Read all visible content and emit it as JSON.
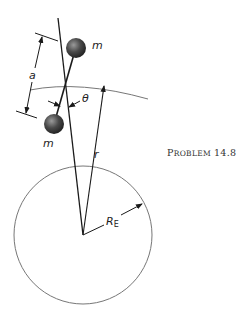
{
  "figure": {
    "caption_prefix_big": "P",
    "caption_prefix_small": "ROBLEM",
    "caption_number": "14.8",
    "labels": {
      "mass_top": "m",
      "mass_bottom": "m",
      "separation": "a",
      "angle": "θ",
      "radius_orbit": "r",
      "radius_earth_main": "R",
      "radius_earth_sub": "E"
    },
    "colors": {
      "line": "#1a1a1a",
      "circle": "#777777",
      "ball_dark": "#222222",
      "ball_light": "#8a8a8a"
    }
  }
}
